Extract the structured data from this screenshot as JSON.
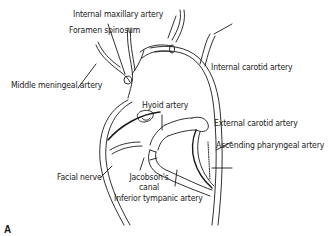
{
  "figure": {
    "panel_label": "A",
    "labels": {
      "internal_maxillary_artery": "Internal maxillary artery",
      "foramen_spinosum": "Foramen spinosum",
      "middle_meningeal_artery": "Middle meningeal artery",
      "internal_carotid_artery": "Internal carotid artery",
      "hyoid_artery": "Hyoid artery",
      "external_carotid_artery": "External carotid artery",
      "ascending_pharyngeal_artery": "Ascending pharyngeal artery",
      "facial_nerve": "Facial nerve",
      "jacobsons_canal_line1": "Jacobson's",
      "jacobsons_canal_line2": "canal",
      "inferior_tympanic_artery": "Inferior tympanic artery"
    },
    "colors": {
      "line": "#1a1a1a",
      "background": "#ffffff"
    }
  }
}
